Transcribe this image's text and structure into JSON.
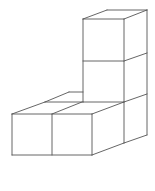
{
  "diagram": {
    "type": "isometric-cube-stack",
    "cube_count": 5,
    "stroke_color": "#555555",
    "background": "#ffffff",
    "segments": [
      [
        83,
        19,
        124,
        19
      ],
      [
        83,
        19,
        107,
        10
      ],
      [
        107,
        10,
        147,
        10
      ],
      [
        124,
        19,
        147,
        10
      ],
      [
        83,
        19,
        83,
        102
      ],
      [
        124,
        19,
        124,
        143
      ],
      [
        147,
        10,
        147,
        135
      ],
      [
        83,
        61,
        124,
        61
      ],
      [
        124,
        61,
        147,
        53
      ],
      [
        83,
        102,
        124,
        102
      ],
      [
        124,
        102,
        147,
        94
      ],
      [
        124,
        143,
        147,
        135
      ],
      [
        12,
        114,
        92,
        114
      ],
      [
        12,
        114,
        12,
        155
      ],
      [
        12,
        155,
        92,
        155
      ],
      [
        52,
        114,
        52,
        155
      ],
      [
        92,
        114,
        92,
        155
      ],
      [
        12,
        114,
        45,
        102
      ],
      [
        45,
        102,
        83,
        102
      ],
      [
        52,
        114,
        82,
        102
      ],
      [
        45,
        102,
        69,
        92
      ],
      [
        69,
        92,
        83,
        92
      ],
      [
        92,
        114,
        124,
        102
      ],
      [
        92,
        155,
        124,
        143
      ]
    ]
  }
}
